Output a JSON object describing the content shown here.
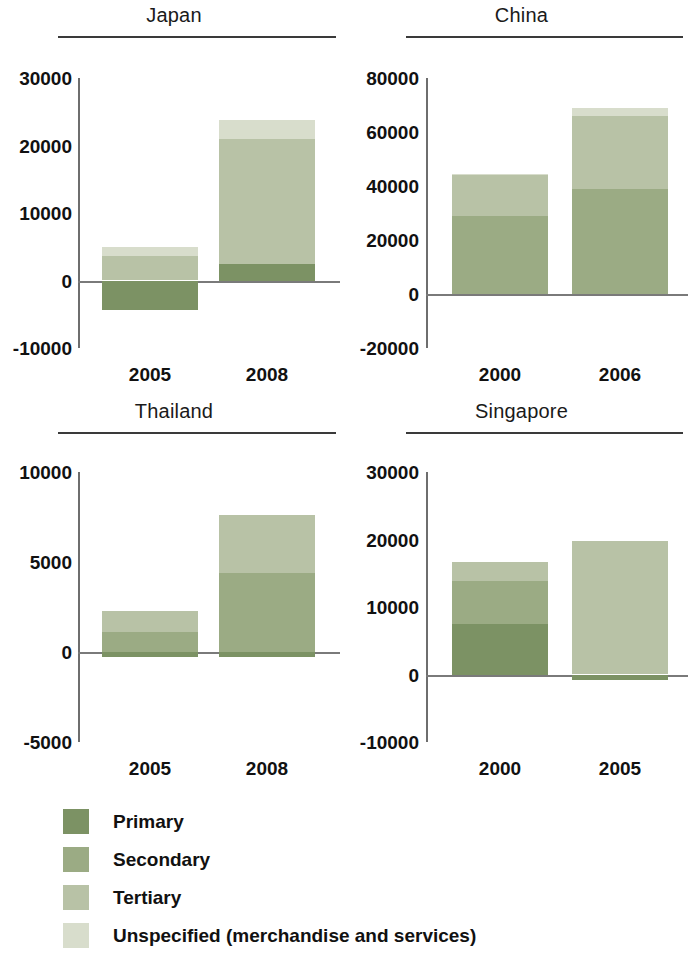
{
  "figure": {
    "title": "",
    "background": "#ffffff"
  },
  "series_colors": {
    "primary": "#7c9264",
    "secondary": "#9bab84",
    "tertiary": "#b8c2a6",
    "unspecified": "#d8ddcc"
  },
  "legend": {
    "position": "bottom-left",
    "items": [
      {
        "label": "Primary",
        "color": "#7c9264"
      },
      {
        "label": "Secondary",
        "color": "#9bab84"
      },
      {
        "label": "Tertiary",
        "color": "#b8c2a6"
      },
      {
        "label": "Unspecified (merchandise and services)",
        "color": "#d8ddcc"
      }
    ]
  },
  "chart_data": [
    {
      "type": "bar",
      "stacked": true,
      "title": "Japan",
      "xlabel": "",
      "ylabel": "",
      "categories": [
        "2005",
        "2008"
      ],
      "ticks": [
        -10000,
        0,
        10000,
        20000,
        30000
      ],
      "tick_labels": [
        "-10000",
        "0",
        "10000",
        "20000",
        "30000"
      ],
      "ylim": [
        -10000,
        30000
      ],
      "grid": false,
      "series": [
        {
          "name": "Primary",
          "values": [
            -4300,
            2500
          ]
        },
        {
          "name": "Secondary",
          "values": [
            0,
            0
          ]
        },
        {
          "name": "Tertiary",
          "values": [
            3600,
            18500
          ]
        },
        {
          "name": "Unspecified (merchandise and services)",
          "values": [
            1400,
            2800
          ]
        }
      ]
    },
    {
      "type": "bar",
      "stacked": true,
      "title": "China",
      "xlabel": "",
      "ylabel": "",
      "categories": [
        "2000",
        "2006"
      ],
      "ticks": [
        -20000,
        0,
        20000,
        40000,
        60000,
        80000
      ],
      "tick_labels": [
        "-20000",
        "0",
        "20000",
        "40000",
        "60000",
        "80000"
      ],
      "ylim": [
        -20000,
        80000
      ],
      "grid": false,
      "series": [
        {
          "name": "Primary",
          "values": [
            0,
            0
          ]
        },
        {
          "name": "Secondary",
          "values": [
            29000,
            39000
          ]
        },
        {
          "name": "Tertiary",
          "values": [
            15000,
            27000
          ]
        },
        {
          "name": "Unspecified (merchandise and services)",
          "values": [
            400,
            3000
          ]
        }
      ]
    },
    {
      "type": "bar",
      "stacked": true,
      "title": "Thailand",
      "xlabel": "",
      "ylabel": "",
      "categories": [
        "2005",
        "2008"
      ],
      "ticks": [
        -5000,
        0,
        5000,
        10000
      ],
      "tick_labels": [
        "-5000",
        "0",
        "5000",
        "10000"
      ],
      "ylim": [
        -5000,
        10000
      ],
      "grid": false,
      "series": [
        {
          "name": "Primary",
          "values": [
            -250,
            -300
          ]
        },
        {
          "name": "Secondary",
          "values": [
            1100,
            4400
          ]
        },
        {
          "name": "Tertiary",
          "values": [
            1200,
            3200
          ]
        },
        {
          "name": "Unspecified (merchandise and services)",
          "values": [
            0,
            0
          ]
        }
      ]
    },
    {
      "type": "bar",
      "stacked": true,
      "title": "Singapore",
      "xlabel": "",
      "ylabel": "",
      "categories": [
        "2000",
        "2005"
      ],
      "ticks": [
        -10000,
        0,
        10000,
        20000,
        30000
      ],
      "tick_labels": [
        "-10000",
        "0",
        "10000",
        "20000",
        "30000"
      ],
      "ylim": [
        -10000,
        30000
      ],
      "grid": false,
      "series": [
        {
          "name": "Primary",
          "values": [
            7500,
            -800
          ]
        },
        {
          "name": "Secondary",
          "values": [
            6400,
            0
          ]
        },
        {
          "name": "Tertiary",
          "values": [
            2800,
            19800
          ]
        },
        {
          "name": "Unspecified (merchandise and services)",
          "values": [
            0,
            0
          ]
        }
      ]
    }
  ]
}
